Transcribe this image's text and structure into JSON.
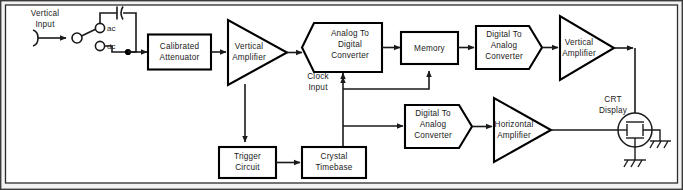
{
  "diagram": {
    "input_label_line1": "Vertical",
    "input_label_line2": "Input",
    "switch": {
      "ac_label": "ac",
      "dc_label": "dc"
    },
    "clock": {
      "label_line1": "Clock",
      "label_line2": "Input"
    },
    "crt": {
      "label_line1": "CRT",
      "label_line2": "Display"
    },
    "blocks": {
      "attenuator": {
        "line1": "Calibrated",
        "line2": "Attenuator"
      },
      "vertical_amp_1": {
        "line1": "Vertical",
        "line2": "Amplifier"
      },
      "adc": {
        "line1": "Analog To",
        "line2": "Digital",
        "line3": "Converter"
      },
      "memory": {
        "line1": "Memory"
      },
      "dac_top": {
        "line1": "Digital To",
        "line2": "Analog",
        "line3": "Converter"
      },
      "vertical_amp_2": {
        "line1": "Vertical",
        "line2": "Amplifier"
      },
      "trigger": {
        "line1": "Trigger",
        "line2": "Circuit"
      },
      "timebase": {
        "line1": "Crystal",
        "line2": "Timebase"
      },
      "dac_bottom": {
        "line1": "Digital To",
        "line2": "Analog",
        "line3": "Converter"
      },
      "horizontal_amp": {
        "line1": "Horizontal",
        "line2": "Amplifier"
      }
    },
    "colors": {
      "background": "#f2f2f2",
      "canvas": "#ffffff",
      "ink": "#1a1a1a",
      "block_stroke": "#000000"
    }
  }
}
